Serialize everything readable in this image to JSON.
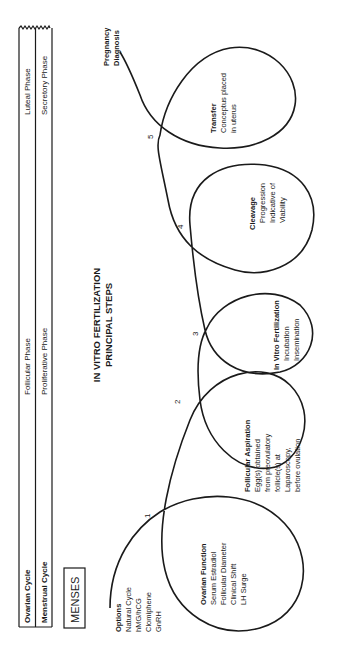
{
  "title": {
    "line1": "IN VITRO FERTILIZATION",
    "line2": "PRINCIPAL STEPS"
  },
  "cycle_table": {
    "rows": [
      {
        "label": "Ovarian Cycle",
        "phase1": "Follicular Phase",
        "phase2": "Luteal Phase"
      },
      {
        "label": "Menstrual Cycle",
        "phase1": "Proliferative Phase",
        "phase2": "Secretory Phase"
      }
    ]
  },
  "menses_label": "MENSES",
  "options": {
    "heading": "Options",
    "items": [
      "Natural Cycle",
      "hMG/hCG",
      "Clomiphene",
      "GnRH"
    ]
  },
  "steps": [
    {
      "number": "1",
      "title": "Ovarian Function",
      "lines": [
        "Serum Estradiol",
        "Follicular Diameter",
        "Clinical Shift",
        "LH Surge"
      ]
    },
    {
      "number": "2",
      "title": "Follicular Aspiration",
      "lines": [
        "Egg(s) obtained",
        "from preovulatory",
        "follicle(s) at",
        "Laparoscopy,",
        "before ovulation"
      ]
    },
    {
      "number": "3",
      "title": "In Vitro Fertilization",
      "lines": [
        "Incubation",
        "Insemination"
      ]
    },
    {
      "number": "4",
      "title": "Cleavage",
      "lines": [
        "Progression",
        "Indicative of",
        "Viability"
      ]
    },
    {
      "number": "5",
      "title": "Transfer",
      "lines": [
        "Conceptus placed",
        "in uterus"
      ]
    }
  ],
  "end_label": {
    "line1": "Pregnancy",
    "line2": "Diagnosis"
  }
}
